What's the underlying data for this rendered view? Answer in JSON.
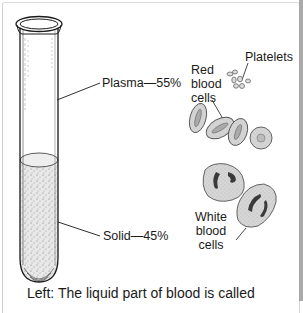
{
  "diagram": {
    "tube_labels": {
      "plasma": "Plasma—55%",
      "solid": "Solid—45%"
    },
    "cell_labels": {
      "platelets": "Platelets",
      "red_blood_cells": [
        "Red",
        "blood",
        "cells"
      ],
      "white_blood_cells": [
        "White",
        "blood",
        "cells"
      ]
    },
    "caption": "Left: The liquid part of blood is called",
    "colors": {
      "line": "#1a1a1a",
      "cell_fill": "#d4d4d4",
      "cell_outline": "#555555",
      "nucleus": "#3a3a3a",
      "frame": "#cfcfcf",
      "right_bar": "#a9a9a9"
    }
  }
}
